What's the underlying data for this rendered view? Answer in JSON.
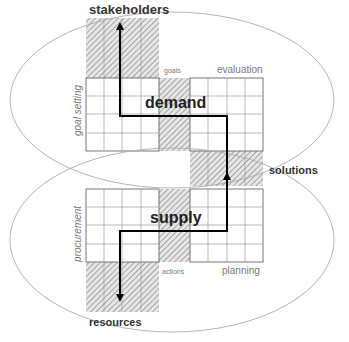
{
  "diagram": {
    "regions": {
      "top": {
        "name": "demand",
        "label": "demand"
      },
      "bottom": {
        "name": "supply",
        "label": "supply"
      }
    },
    "labels": {
      "stakeholders": "stakeholders",
      "goal_setting": "goal setting",
      "goals": "goals",
      "evaluation": "evaluation",
      "solutions": "solutions",
      "procurement": "procurement",
      "actions": "actions",
      "planning": "planning",
      "resources": "resources"
    },
    "colors": {
      "grid_line": "#999999",
      "outline": "#555555",
      "hatch": "#888888",
      "arrow": "#000000",
      "ellipse": "#aaaaaa"
    }
  }
}
